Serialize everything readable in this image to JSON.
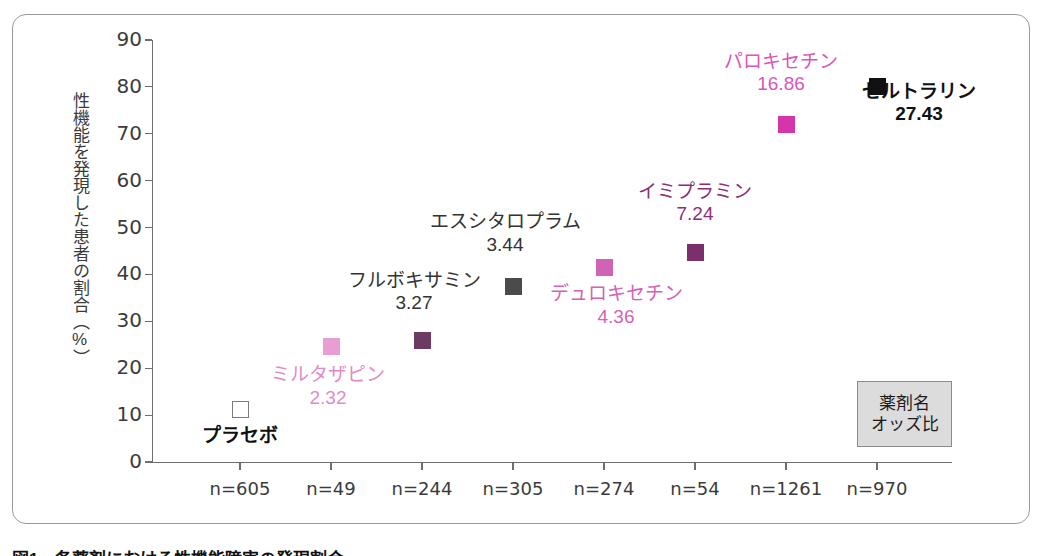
{
  "chart_data": {
    "type": "scatter",
    "title": "",
    "xlabel": "",
    "ylabel": "性機能を発現した患者の割合（%）",
    "ylim": [
      0,
      90
    ],
    "ytick_labels": [
      "90",
      "80",
      "70",
      "60",
      "50",
      "40",
      "30",
      "20",
      "10",
      "0"
    ],
    "ytick_values": [
      90,
      80,
      70,
      60,
      50,
      40,
      30,
      20,
      10,
      0
    ],
    "grid": false,
    "legend_position": "bottom-right",
    "xtick_labels": [
      "n=605",
      "n=49",
      "n=244",
      "n=305",
      "n=274",
      "n=54",
      "n=1261",
      "n=970"
    ],
    "categories": [
      "プラセボ",
      "ミルタザピン",
      "フルボキサミン",
      "エスシタロプラム",
      "デュロキセチン",
      "イミプラミン",
      "パロキセチン",
      "セルトラリン"
    ],
    "values": [
      11.3,
      24.7,
      26.0,
      37.5,
      41.5,
      44.6,
      71.9,
      80.0
    ],
    "odds_ratios": [
      "",
      "2.32",
      "3.27",
      "3.44",
      "4.36",
      "7.24",
      "16.86",
      "27.43"
    ],
    "points": [
      {
        "name": "プラセボ",
        "odds": "",
        "n": "n=605",
        "value": 11.3,
        "color": "#ffffff",
        "marker": "hollow-square",
        "label_color": "#111111",
        "bold": true
      },
      {
        "name": "ミルタザピン",
        "odds": "2.32",
        "n": "n=49",
        "value": 24.7,
        "color": "#e89ed2",
        "marker": "square",
        "label_color": "#e08cc6",
        "bold": false
      },
      {
        "name": "フルボキサミン",
        "odds": "3.27",
        "n": "n=244",
        "value": 26.0,
        "color": "#6d3a63",
        "marker": "square",
        "label_color": "#333333",
        "bold": false
      },
      {
        "name": "エスシタロプラム",
        "odds": "3.44",
        "n": "n=305",
        "value": 37.5,
        "color": "#4b4b4b",
        "marker": "square",
        "label_color": "#333333",
        "bold": false
      },
      {
        "name": "デュロキセチン",
        "odds": "4.36",
        "n": "n=274",
        "value": 41.5,
        "color": "#d063b4",
        "marker": "square",
        "label_color": "#d463b4",
        "bold": false
      },
      {
        "name": "イミプラミン",
        "odds": "7.24",
        "n": "n=54",
        "value": 44.6,
        "color": "#7b2f6b",
        "marker": "square",
        "label_color": "#8c2f78",
        "bold": false
      },
      {
        "name": "パロキセチン",
        "odds": "16.86",
        "n": "n=1261",
        "value": 71.9,
        "color": "#d435aa",
        "marker": "square",
        "label_color": "#d957b5",
        "bold": false
      },
      {
        "name": "セルトラリン",
        "odds": "27.43",
        "n": "n=970",
        "value": 80.0,
        "color": "#111111",
        "marker": "square",
        "label_color": "#111111",
        "bold": true
      }
    ]
  },
  "legend": {
    "line1": "薬剤名",
    "line2": "オッズ比"
  },
  "caption": {
    "text": "図1　各薬剤における性機能障害の発現割合"
  },
  "colors": {
    "axis": "#6e6e6e",
    "frame": "#9a9a9a",
    "legend_bg": "#dcdcdc",
    "text": "#3b3b3b"
  }
}
